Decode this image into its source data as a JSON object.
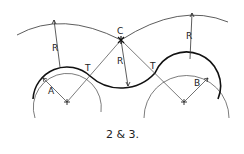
{
  "figure": {
    "caption": "2 & 3.",
    "labels": {
      "center_a": "A",
      "center_b": "B",
      "center_c": "C",
      "radius_left": "R",
      "radius_center": "R",
      "radius_right": "R",
      "tangent_left": "T",
      "tangent_right": "T"
    },
    "colors": {
      "ink": "#222222",
      "thin": "#555555",
      "background": "#ffffff"
    }
  }
}
